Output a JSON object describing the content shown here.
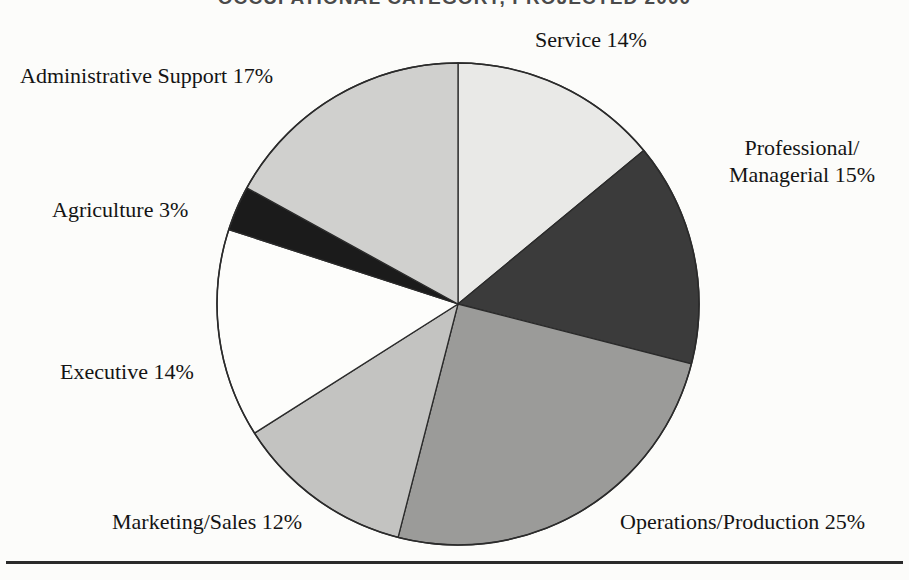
{
  "document": {
    "title": "OCCUPATIONAL CATEGORY, PROJECTED 2000",
    "rule": "horizontal-rule"
  },
  "chart_data": {
    "type": "pie",
    "title": "OCCUPATIONAL CATEGORY, PROJECTED 2000",
    "xlabel": "",
    "ylabel": "",
    "units": "percent",
    "total": 100,
    "start_angle_deg": 0,
    "direction": "clockwise",
    "legend_position": "outside-labels",
    "grid": false,
    "categories": [
      "Service",
      "Professional/Managerial",
      "Operations/Production",
      "Marketing/Sales",
      "Executive",
      "Agriculture",
      "Administrative Support"
    ],
    "values": [
      14,
      15,
      25,
      12,
      14,
      3,
      17
    ],
    "colors": [
      "#e9e9e7",
      "#3b3b3b",
      "#9b9b99",
      "#c3c3c1",
      "#fdfdfb",
      "#1b1b1b",
      "#d0d0ce"
    ],
    "slices": [
      {
        "label": "Service",
        "value": 14,
        "display": "Service 14%",
        "color": "#e9e9e7",
        "start_deg": 0,
        "end_deg": 50.4
      },
      {
        "label": "Professional/Managerial",
        "value": 15,
        "display": "Managerial 15%",
        "color": "#3b3b3b",
        "start_deg": 50.4,
        "end_deg": 104.4
      },
      {
        "label": "Operations/Production",
        "value": 25,
        "display": "Operations/Production 25%",
        "color": "#9b9b99",
        "start_deg": 104.4,
        "end_deg": 194.4
      },
      {
        "label": "Marketing/Sales",
        "value": 12,
        "display": "Marketing/Sales 12%",
        "color": "#c3c3c1",
        "start_deg": 194.4,
        "end_deg": 237.6
      },
      {
        "label": "Executive",
        "value": 14,
        "display": "Executive 14%",
        "color": "#fdfdfb",
        "start_deg": 237.6,
        "end_deg": 288.0
      },
      {
        "label": "Agriculture",
        "value": 3,
        "display": "Agriculture 3%",
        "color": "#1b1b1b",
        "start_deg": 288.0,
        "end_deg": 298.8
      },
      {
        "label": "Administrative Support",
        "value": 17,
        "display": "Administrative Support 17%",
        "color": "#d0d0ce",
        "start_deg": 298.8,
        "end_deg": 360.0
      }
    ]
  },
  "labels": {
    "service": "Service 14%",
    "professional_line1": "Professional/",
    "professional_line2": "Managerial 15%",
    "administrative_support": "Administrative Support 17%",
    "agriculture": "Agriculture 3%",
    "executive": "Executive 14%",
    "marketing_sales": "Marketing/Sales 12%",
    "operations_production": "Operations/Production 25%"
  }
}
